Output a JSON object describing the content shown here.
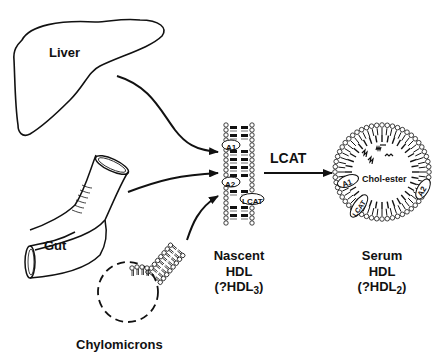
{
  "diagram": {
    "sources": [
      {
        "id": "liver",
        "label": "Liver"
      },
      {
        "id": "gut",
        "label": "Gut"
      },
      {
        "id": "chylomicrons",
        "label": "Chylomicrons"
      }
    ],
    "nascent_hdl": {
      "line1": "Nascent",
      "line2": "HDL",
      "line3_prefix": "(?HDL",
      "line3_sub": "3",
      "line3_suffix": ")",
      "apoproteins": [
        "A1",
        "A2",
        "LCAT"
      ]
    },
    "conversion_arrow": {
      "label": "LCAT"
    },
    "serum_hdl": {
      "line1": "Serum",
      "line2": "HDL",
      "line3_prefix": "(?HDL",
      "line3_sub": "2",
      "line3_suffix": ")",
      "core_label": "Chol-ester",
      "apoproteins": [
        "A1",
        "A2",
        "LCAT"
      ]
    },
    "edges": [
      {
        "from": "Liver",
        "to": "Nascent HDL"
      },
      {
        "from": "Gut",
        "to": "Nascent HDL"
      },
      {
        "from": "Chylomicrons",
        "to": "Nascent HDL"
      },
      {
        "from": "Nascent HDL",
        "to": "Serum HDL",
        "label": "LCAT"
      }
    ]
  }
}
